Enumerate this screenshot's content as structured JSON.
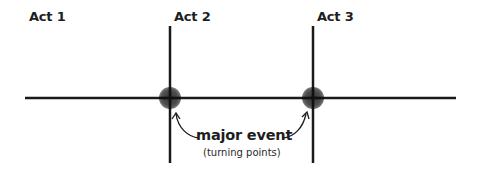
{
  "acts": [
    {
      "label": "Act 1"
    },
    {
      "label": "Act 2"
    },
    {
      "label": "Act 3"
    }
  ],
  "annotation": {
    "title": "major event",
    "subtitle": "(turning points)"
  },
  "colors": {
    "line": "#1a1a1a",
    "marker": "#2b2b2b",
    "text": "#1e1e1e"
  }
}
